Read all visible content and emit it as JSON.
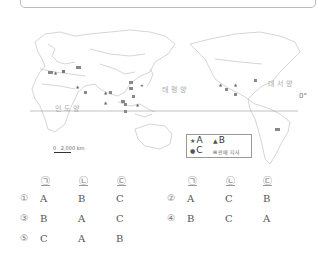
{
  "map": {
    "oceans": {
      "indian": "인도양",
      "pacific": "태평양",
      "atlantic": "대서양"
    },
    "equator_label": "0°",
    "scale": {
      "zero": "0",
      "distance": "2,000 km"
    },
    "legend": {
      "a_symbol": "★",
      "a_label": "A",
      "b_symbol": "▲",
      "b_label": "B",
      "c_symbol": "●",
      "c_label": "C",
      "branch_symbol": "⊞",
      "branch_label": "판매 지사"
    }
  },
  "answer_choices": {
    "headers": [
      "㉠",
      "㉡",
      "㉢"
    ],
    "options": [
      {
        "num": "①",
        "values": [
          "A",
          "B",
          "C"
        ]
      },
      {
        "num": "②",
        "values": [
          "A",
          "C",
          "B"
        ]
      },
      {
        "num": "③",
        "values": [
          "B",
          "A",
          "C"
        ]
      },
      {
        "num": "④",
        "values": [
          "B",
          "C",
          "A"
        ]
      },
      {
        "num": "⑤",
        "values": [
          "C",
          "A",
          "B"
        ]
      }
    ]
  }
}
